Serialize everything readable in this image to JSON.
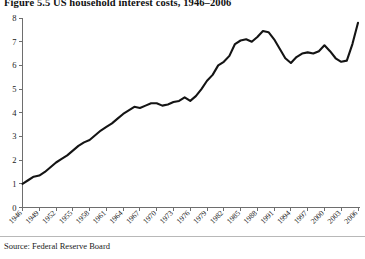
{
  "figure": {
    "title": "Figure 5.5  US household interest costs, 1946–2006",
    "source": "Source: Federal Reserve Board"
  },
  "chart_data": {
    "type": "line",
    "title": "Figure 5.5  US household interest costs, 1946–2006",
    "xlabel": "",
    "ylabel": "",
    "xlim": [
      1946,
      2006
    ],
    "ylim": [
      0,
      8
    ],
    "yticks": [
      0,
      1,
      2,
      3,
      4,
      5,
      6,
      7,
      8
    ],
    "ytick_labels": [
      "0",
      "1",
      "2",
      "3",
      "4",
      "5",
      "6",
      "7",
      "8"
    ],
    "xticks": [
      1946,
      1949,
      1952,
      1955,
      1958,
      1961,
      1964,
      1967,
      1970,
      1973,
      1976,
      1979,
      1982,
      1985,
      1988,
      1991,
      1994,
      1997,
      2000,
      2003,
      2006
    ],
    "xtick_labels": [
      "1946",
      "1949",
      "1952",
      "1955",
      "1958",
      "1961",
      "1964",
      "1967",
      "1970",
      "1973",
      "1976",
      "1979",
      "1982",
      "1985",
      "1988",
      "1991",
      "1994",
      "1997",
      "2000",
      "2003",
      "2006"
    ],
    "xtick_rotation": 45,
    "grid": false,
    "legend": false,
    "line_color": "#141414",
    "series": [
      {
        "name": "US household interest costs",
        "x": [
          1946,
          1947,
          1948,
          1949,
          1950,
          1951,
          1952,
          1953,
          1954,
          1955,
          1956,
          1957,
          1958,
          1959,
          1960,
          1961,
          1962,
          1963,
          1964,
          1965,
          1966,
          1967,
          1968,
          1969,
          1970,
          1971,
          1972,
          1973,
          1974,
          1975,
          1976,
          1977,
          1978,
          1979,
          1980,
          1981,
          1982,
          1983,
          1984,
          1985,
          1986,
          1987,
          1988,
          1989,
          1990,
          1991,
          1992,
          1993,
          1994,
          1995,
          1996,
          1997,
          1998,
          1999,
          2000,
          2001,
          2002,
          2003,
          2004,
          2005,
          2006
        ],
        "y": [
          1.0,
          1.15,
          1.3,
          1.35,
          1.5,
          1.7,
          1.9,
          2.05,
          2.2,
          2.4,
          2.6,
          2.75,
          2.85,
          3.05,
          3.25,
          3.4,
          3.55,
          3.75,
          3.95,
          4.1,
          4.25,
          4.2,
          4.3,
          4.4,
          4.4,
          4.3,
          4.35,
          4.45,
          4.5,
          4.65,
          4.5,
          4.7,
          5.0,
          5.35,
          5.6,
          6.0,
          6.15,
          6.4,
          6.9,
          7.05,
          7.1,
          7.0,
          7.2,
          7.45,
          7.4,
          7.1,
          6.7,
          6.3,
          6.1,
          6.35,
          6.5,
          6.55,
          6.5,
          6.6,
          6.85,
          6.6,
          6.3,
          6.15,
          6.2,
          6.9,
          7.8
        ]
      }
    ]
  }
}
